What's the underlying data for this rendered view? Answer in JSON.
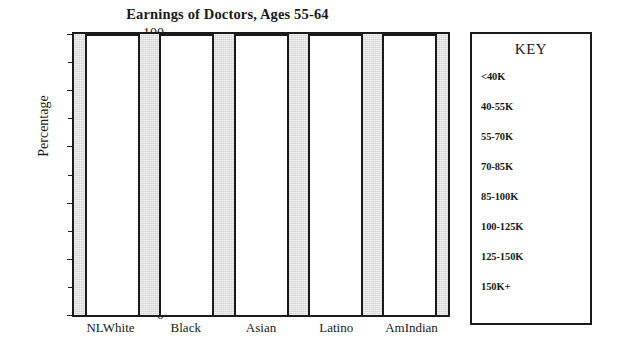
{
  "chart_data": {
    "type": "bar",
    "title": "Earnings of Doctors, Ages 55-64",
    "xlabel": "",
    "ylabel": "Percentage",
    "categories": [
      "NLWhite",
      "Black",
      "Asian",
      "Latino",
      "AmIndian"
    ],
    "values": [
      100,
      100,
      100,
      100,
      100
    ],
    "ylim": [
      0,
      100
    ],
    "y_major_ticks": [
      0,
      20,
      40,
      60,
      80,
      100
    ],
    "y_major_tick_labels": [
      "0",
      "20",
      "40",
      "60",
      "80",
      "100"
    ],
    "y_minor_ticks": [
      10,
      30,
      50,
      70,
      90
    ],
    "grid": false,
    "legend_position": "right",
    "plot_background_color": "#d2d2d2",
    "bar_fill_color": "#ffffff",
    "bar_border_color": "#1a1a1a",
    "legend": {
      "title": "KEY",
      "entries": [
        "<40K",
        "40-55K",
        "55-70K",
        "70-85K",
        "85-100K",
        "100-125K",
        "125-150K",
        "150K+"
      ]
    }
  }
}
